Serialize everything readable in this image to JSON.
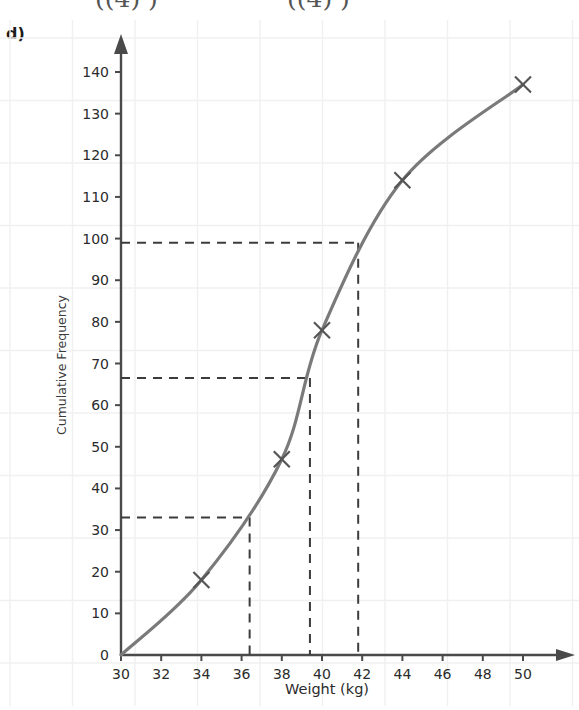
{
  "page": {
    "partial_top_fragments": [
      "((4)        )",
      "((4)        )"
    ],
    "part_label": "d)"
  },
  "chart_data": {
    "type": "line",
    "title": "",
    "xlabel": "Weight (kg)",
    "ylabel": "Cumulative Frequency",
    "xlim": [
      30,
      51.5
    ],
    "ylim": [
      0,
      145
    ],
    "grid": true,
    "legend": "none",
    "x_ticks": [
      30,
      32,
      34,
      36,
      38,
      40,
      42,
      44,
      46,
      48,
      50
    ],
    "y_ticks": [
      0,
      10,
      20,
      30,
      40,
      50,
      60,
      70,
      80,
      90,
      100,
      110,
      120,
      130,
      140
    ],
    "series": [
      {
        "name": "Cumulative frequency",
        "marker": "x",
        "color": "#7a7a7a",
        "x": [
          30,
          34,
          38,
          40,
          44,
          50
        ],
        "values": [
          0,
          18,
          47,
          78,
          114,
          137
        ]
      }
    ],
    "annotations": [
      {
        "name": "lower-quartile-guide",
        "style": "dashed",
        "y": 33,
        "x": 36.4,
        "label": "Q1 guide"
      },
      {
        "name": "median-guide",
        "style": "dashed",
        "y": 66.5,
        "x": 39.4,
        "label": "Median guide"
      },
      {
        "name": "upper-quartile-guide",
        "style": "dashed",
        "y": 99,
        "x": 41.8,
        "label": "Q3 guide"
      }
    ],
    "colors": {
      "curve": "#7a7a7a",
      "axis": "#4a4a4a",
      "grid": "#f0f0f2",
      "dashed": "#3c3c3c",
      "text": "#2b2b2b"
    }
  },
  "axis_tick_labels": {
    "x": [
      "30",
      "32",
      "34",
      "36",
      "38",
      "40",
      "42",
      "44",
      "46",
      "48",
      "50"
    ],
    "y": [
      "0",
      "10",
      "20",
      "30",
      "40",
      "50",
      "60",
      "70",
      "80",
      "90",
      "100",
      "110",
      "120",
      "130",
      "140"
    ]
  }
}
